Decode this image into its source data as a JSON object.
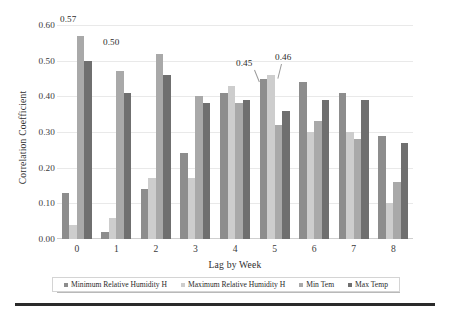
{
  "chart_data": {
    "type": "bar",
    "title": "",
    "xlabel": "Lag by Week",
    "ylabel": "Correlation Coefficient",
    "categories": [
      "0",
      "1",
      "2",
      "3",
      "4",
      "5",
      "6",
      "7",
      "8"
    ],
    "ylim": [
      0.0,
      0.6
    ],
    "ytick_labels": [
      "0.00",
      "0.10",
      "0.20",
      "0.30",
      "0.40",
      "0.50",
      "0.60"
    ],
    "ytick_values": [
      0.0,
      0.1,
      0.2,
      0.3,
      0.4,
      0.5,
      0.6
    ],
    "grid": true,
    "legend_position": "bottom",
    "series": [
      {
        "name": "Minimum Relative Humidity H",
        "color": "#8d8d8d",
        "values": [
          0.13,
          0.02,
          0.14,
          0.24,
          0.41,
          0.45,
          0.44,
          0.41,
          0.29
        ]
      },
      {
        "name": "Maximum Relative Humidity H",
        "color": "#cdcdcd",
        "values": [
          0.04,
          0.06,
          0.17,
          0.17,
          0.43,
          0.46,
          0.3,
          0.3,
          0.1
        ]
      },
      {
        "name": "Min Tem",
        "color": "#a9a9a9",
        "values": [
          0.57,
          0.47,
          0.52,
          0.4,
          0.38,
          0.32,
          0.33,
          0.28,
          0.16
        ]
      },
      {
        "name": "Max Temp",
        "color": "#6f6f6f",
        "values": [
          0.5,
          0.41,
          0.46,
          0.38,
          0.39,
          0.36,
          0.39,
          0.39,
          0.27
        ]
      }
    ],
    "annotations": [
      {
        "text": "0.57",
        "group": 0,
        "series": 2,
        "left": 60,
        "top": 14,
        "leader": false
      },
      {
        "text": "0.50",
        "group": 1,
        "series": 3,
        "left": 103,
        "top": 37,
        "leader": false
      },
      {
        "text": "0.45",
        "group": 4,
        "series": 0,
        "left": 236,
        "top": 58,
        "leader": true,
        "leader_left": 254,
        "leader_top": 70,
        "leader_height": 13,
        "leader_rotate": -22
      },
      {
        "text": "0.46",
        "group": 5,
        "series": 1,
        "left": 275,
        "top": 52,
        "leader": true,
        "leader_left": 281,
        "leader_top": 64,
        "leader_height": 15,
        "leader_rotate": 14
      }
    ]
  },
  "legend": {
    "items": [
      {
        "label": "Minimum Relative Humidity H",
        "swatch": "s0",
        "icon": "square-swatch-icon"
      },
      {
        "label": "Maximum Relative Humidity H",
        "swatch": "s1",
        "icon": "square-swatch-icon"
      },
      {
        "label": "Min Tem",
        "swatch": "s2",
        "icon": "square-swatch-icon"
      },
      {
        "label": "Max Temp",
        "swatch": "s3",
        "icon": "square-swatch-icon"
      }
    ]
  }
}
